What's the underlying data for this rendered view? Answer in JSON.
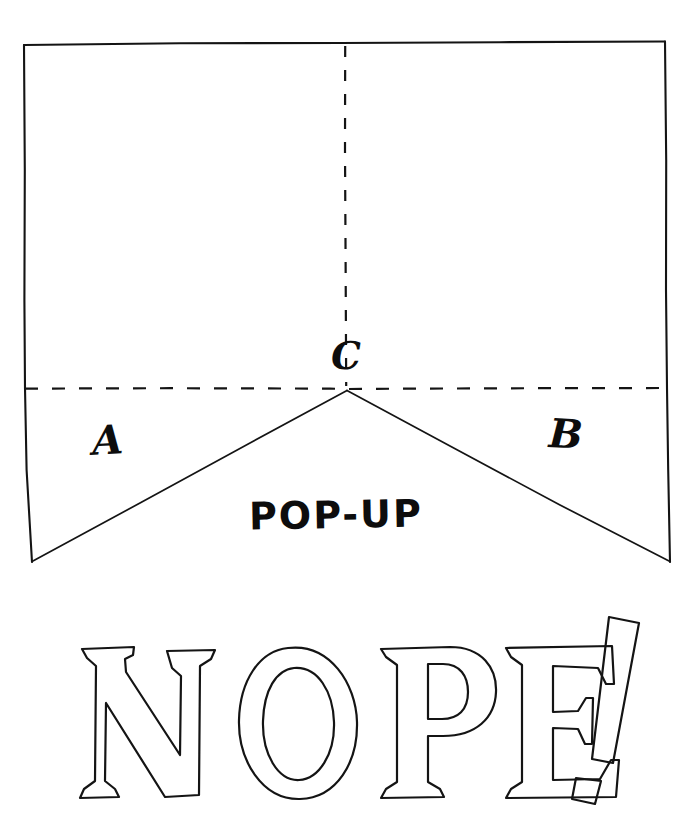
{
  "page": {
    "background_color": "#ffffff",
    "ink_color": "#111111",
    "width": 700,
    "height": 832
  },
  "diagram": {
    "name": "pop-up-fold-diagram",
    "sheet": {
      "label": "card sheet",
      "corners": {
        "top_left": [
          24,
          44
        ],
        "top_right": [
          665,
          42
        ],
        "bottom_right": [
          670,
          562
        ],
        "bottom_left": [
          32,
          562
        ]
      }
    },
    "fold_lines": {
      "vertical": {
        "name": "vertical-fold-line",
        "style": "dashed",
        "from": [
          345,
          44
        ],
        "to": [
          346,
          386
        ]
      },
      "horizontal": {
        "name": "horizontal-fold-line",
        "style": "dashed",
        "from": [
          25,
          388
        ],
        "to": [
          667,
          388
        ]
      }
    },
    "cut_lines": {
      "left": {
        "name": "left-cut-line",
        "style": "solid",
        "from": [
          347,
          390
        ],
        "to": [
          32,
          562
        ]
      },
      "right": {
        "name": "right-cut-line",
        "style": "solid",
        "from": [
          347,
          390
        ],
        "to": [
          670,
          562
        ]
      }
    },
    "labels": [
      {
        "id": "a",
        "text": "A",
        "x": 113,
        "y": 445
      },
      {
        "id": "b",
        "text": "B",
        "x": 571,
        "y": 440
      },
      {
        "id": "c",
        "text": "C",
        "x": 346,
        "y": 357
      },
      {
        "id": "popup",
        "text": "POP-UP",
        "x": 357,
        "y": 520
      }
    ]
  },
  "caption": {
    "name": "nope-caption",
    "text": "NOPE!",
    "letters": [
      "N",
      "O",
      "P",
      "E",
      "!"
    ],
    "style": "outline serif hand lettering",
    "bounds": {
      "x": 78,
      "y": 612,
      "width": 560,
      "height": 195
    }
  }
}
